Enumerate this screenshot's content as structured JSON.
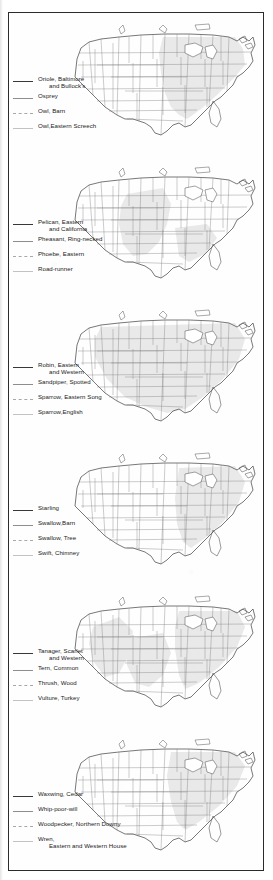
{
  "document": {
    "kind": "scanned-book-page",
    "page_background": "#ffffff",
    "frame_border_color": "#2b2b2b",
    "map_land_fill": "#ffffff",
    "map_shaded_fill": "#e9e9e9",
    "map_outline_color": "#555555",
    "map_state_line_color": "#7a7a7a",
    "text_color": "#222222"
  },
  "line_styles": {
    "1": "solid-dark",
    "2": "solid-mid",
    "3": "dashed",
    "4": "solid-light"
  },
  "panels": [
    {
      "id": "panel-1",
      "map_name": "united-states-range-map-1",
      "legend": [
        {
          "label": "Oriole, Baltimore\nand Bullock's",
          "style": "solid-dark",
          "indent_second_line": true
        },
        {
          "label": "Osprey",
          "style": "solid-mid",
          "indent_second_line": false
        },
        {
          "label": "Owl, Barn",
          "style": "dashed",
          "indent_second_line": false
        },
        {
          "label": "Owl,Eastern Screech",
          "style": "solid-light",
          "indent_second_line": false
        }
      ]
    },
    {
      "id": "panel-2",
      "map_name": "united-states-range-map-2",
      "legend": [
        {
          "label": "Pelican, Eastern\nand California",
          "style": "solid-dark",
          "indent_second_line": true
        },
        {
          "label": "Pheasant, Ring-necked",
          "style": "solid-mid",
          "indent_second_line": false
        },
        {
          "label": "Phoebe, Eastern",
          "style": "dashed",
          "indent_second_line": false
        },
        {
          "label": "Road-runner",
          "style": "solid-light",
          "indent_second_line": false
        }
      ]
    },
    {
      "id": "panel-3",
      "map_name": "united-states-range-map-3",
      "legend": [
        {
          "label": "Robin, Eastern\nand Western",
          "style": "solid-dark",
          "indent_second_line": true
        },
        {
          "label": "Sandpiper, Spotted",
          "style": "solid-mid",
          "indent_second_line": false
        },
        {
          "label": "Sparrow, Eastern Song",
          "style": "dashed",
          "indent_second_line": false
        },
        {
          "label": "Sparrow,English",
          "style": "solid-light",
          "indent_second_line": false
        }
      ]
    },
    {
      "id": "panel-4",
      "map_name": "united-states-range-map-4",
      "legend": [
        {
          "label": "Starling",
          "style": "solid-dark",
          "indent_second_line": false
        },
        {
          "label": "Swallow,Barn",
          "style": "solid-mid",
          "indent_second_line": false
        },
        {
          "label": "Swallow, Tree",
          "style": "dashed",
          "indent_second_line": false
        },
        {
          "label": "Swift, Chimney",
          "style": "solid-light",
          "indent_second_line": false
        }
      ]
    },
    {
      "id": "panel-5",
      "map_name": "united-states-range-map-5",
      "legend": [
        {
          "label": "Tanager, Scarlet\nand Western",
          "style": "solid-dark",
          "indent_second_line": true
        },
        {
          "label": "Tern, Common",
          "style": "solid-mid",
          "indent_second_line": false
        },
        {
          "label": "Thrush, Wood",
          "style": "dashed",
          "indent_second_line": false
        },
        {
          "label": "Vulture, Turkey",
          "style": "solid-light",
          "indent_second_line": false
        }
      ]
    },
    {
      "id": "panel-6",
      "map_name": "united-states-range-map-6",
      "legend": [
        {
          "label": "Waxwing, Cedar",
          "style": "solid-dark",
          "indent_second_line": false
        },
        {
          "label": "Whip-poor-will",
          "style": "solid-mid",
          "indent_second_line": false
        },
        {
          "label": "Woodpecker, Northern Downy",
          "style": "dashed",
          "indent_second_line": false
        },
        {
          "label": "Wren,\nEastern and Western House",
          "style": "solid-light",
          "indent_second_line": true
        }
      ]
    }
  ]
}
